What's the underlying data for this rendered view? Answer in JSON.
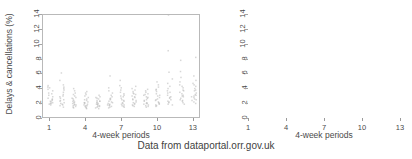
{
  "caption": "Data from dataportal.orr.gov.uk",
  "axis": {
    "ylabel": "Delays & cancellations (%)",
    "xlabel": "4-week periods",
    "yticks": [
      "0",
      "2",
      "4",
      "6",
      "8",
      "10",
      "12",
      "14"
    ],
    "xticks": [
      "1",
      "4",
      "7",
      "10",
      "13"
    ]
  },
  "chart_data": [
    {
      "type": "scatter",
      "title": "",
      "xlabel": "4-week periods",
      "ylabel": "Delays & cancellations (%)",
      "xlim": [
        0.4,
        13.6
      ],
      "ylim": [
        0,
        14
      ],
      "yticks": [
        0,
        2,
        4,
        6,
        8,
        10,
        12,
        14
      ],
      "xticks": [
        1,
        4,
        7,
        10,
        13
      ],
      "grid": false,
      "legend": "none",
      "marker": "strip-jitter",
      "point_color": "#b6b6b6",
      "note": "strip chart: each 4-week period column shows one point per train operator",
      "points": [
        {
          "x": 1,
          "values": [
            1.9,
            2.0,
            2.1,
            2.2,
            2.3,
            2.4,
            2.5,
            2.6,
            2.8,
            3.0,
            3.2,
            3.5,
            3.8,
            4.0,
            4.2,
            4.3,
            4.5,
            2.1,
            2.7,
            3.4
          ]
        },
        {
          "x": 2,
          "values": [
            1.6,
            1.8,
            1.9,
            2.0,
            2.1,
            2.2,
            2.4,
            2.6,
            2.8,
            3.0,
            3.3,
            3.6,
            3.9,
            4.1,
            4.3,
            4.6,
            5.2,
            6.2,
            2.5,
            3.1
          ]
        },
        {
          "x": 3,
          "values": [
            1.5,
            1.6,
            1.7,
            1.8,
            1.9,
            2.0,
            2.1,
            2.2,
            2.3,
            2.5,
            2.7,
            2.9,
            3.1,
            3.3,
            3.5,
            3.8,
            4.1,
            1.9,
            2.4,
            2.8
          ]
        },
        {
          "x": 4,
          "values": [
            1.4,
            1.5,
            1.6,
            1.7,
            1.8,
            1.9,
            2.0,
            2.1,
            2.2,
            2.3,
            2.5,
            2.7,
            2.9,
            3.1,
            3.3,
            3.5,
            3.7,
            1.8,
            2.2,
            2.6
          ]
        },
        {
          "x": 5,
          "values": [
            1.4,
            1.5,
            1.6,
            1.7,
            1.8,
            1.9,
            2.0,
            2.1,
            2.2,
            2.3,
            2.4,
            2.5,
            2.7,
            2.9,
            3.0,
            3.2,
            1.7,
            2.0,
            2.4,
            2.8
          ]
        },
        {
          "x": 6,
          "values": [
            1.5,
            1.6,
            1.7,
            1.8,
            1.9,
            2.0,
            2.1,
            2.2,
            2.4,
            2.6,
            2.8,
            3.0,
            3.2,
            3.5,
            3.8,
            4.2,
            5.8,
            1.9,
            2.3,
            2.7
          ]
        },
        {
          "x": 7,
          "values": [
            1.6,
            1.7,
            1.8,
            1.9,
            2.0,
            2.2,
            2.4,
            2.6,
            2.8,
            3.0,
            3.2,
            3.4,
            3.6,
            3.9,
            4.2,
            4.5,
            5.2,
            2.1,
            2.5,
            3.1
          ]
        },
        {
          "x": 8,
          "values": [
            1.7,
            1.8,
            1.9,
            2.0,
            2.1,
            2.3,
            2.5,
            2.7,
            2.9,
            3.1,
            3.3,
            3.5,
            3.7,
            3.9,
            4.1,
            4.4,
            2.2,
            2.6,
            3.0,
            3.4
          ]
        },
        {
          "x": 9,
          "values": [
            1.6,
            1.7,
            1.8,
            1.9,
            2.0,
            2.1,
            2.2,
            2.4,
            2.6,
            2.8,
            3.0,
            3.2,
            3.4,
            3.6,
            3.8,
            4.0,
            2.1,
            2.5,
            2.9,
            3.3
          ]
        },
        {
          "x": 10,
          "values": [
            1.7,
            1.8,
            1.9,
            2.0,
            2.1,
            2.3,
            2.5,
            2.7,
            2.9,
            3.1,
            3.4,
            3.7,
            4.0,
            4.3,
            4.6,
            5.0,
            2.2,
            2.6,
            3.2,
            3.9
          ]
        },
        {
          "x": 11,
          "values": [
            1.9,
            2.0,
            2.2,
            2.4,
            2.6,
            2.8,
            3.0,
            3.2,
            3.5,
            3.8,
            4.1,
            4.4,
            4.8,
            5.4,
            6.3,
            9.2,
            14.0,
            2.3,
            2.9,
            3.6
          ]
        },
        {
          "x": 12,
          "values": [
            2.0,
            2.2,
            2.4,
            2.6,
            2.8,
            3.0,
            3.2,
            3.4,
            3.6,
            3.9,
            4.2,
            4.6,
            5.0,
            5.6,
            6.4,
            7.9,
            2.5,
            3.1,
            3.8,
            4.4
          ]
        },
        {
          "x": 13,
          "values": [
            2.1,
            2.3,
            2.5,
            2.7,
            2.9,
            3.1,
            3.3,
            3.5,
            3.8,
            4.1,
            4.4,
            4.8,
            5.2,
            5.8,
            8.3,
            2.6,
            3.2,
            3.9,
            4.6,
            3.0
          ]
        }
      ]
    },
    {
      "type": "line",
      "title": "",
      "xlabel": "4-week periods",
      "ylabel": "Delays & cancellations (%)",
      "xlim": [
        1,
        13
      ],
      "ylim": [
        0,
        14
      ],
      "yticks": [
        0,
        2,
        4,
        6,
        8,
        10,
        12,
        14
      ],
      "xticks": [
        1,
        4,
        7,
        10,
        13
      ],
      "grid": false,
      "legend": "none",
      "x": [
        1,
        2,
        3,
        4,
        5,
        6,
        7,
        8,
        9,
        10,
        11,
        12,
        13
      ],
      "series": [
        {
          "name": "operator-01",
          "color": "#c8c8c8",
          "values": [
            4.5,
            6.2,
            3.4,
            2.7,
            3.2,
            5.8,
            5.2,
            4.0,
            3.6,
            4.9,
            14.0,
            7.9,
            8.3
          ]
        },
        {
          "name": "operator-02",
          "color": "#bdbdbd",
          "values": [
            4.3,
            4.6,
            3.1,
            2.5,
            2.6,
            3.5,
            4.5,
            4.4,
            3.8,
            4.6,
            9.2,
            6.4,
            5.6
          ]
        },
        {
          "name": "operator-03",
          "color": "#b2b2b2",
          "values": [
            4.2,
            4.3,
            2.9,
            2.4,
            2.4,
            3.0,
            4.2,
            4.1,
            3.5,
            4.3,
            6.3,
            5.6,
            5.2
          ]
        },
        {
          "name": "operator-04",
          "color": "#a8a8a8",
          "values": [
            4.0,
            4.1,
            2.8,
            2.3,
            2.3,
            2.8,
            3.9,
            3.9,
            3.3,
            4.0,
            5.4,
            5.0,
            4.8
          ]
        },
        {
          "name": "operator-05",
          "color": "#9e9e9e",
          "values": [
            3.8,
            3.9,
            2.7,
            2.2,
            2.2,
            2.6,
            3.6,
            3.7,
            3.1,
            3.7,
            4.8,
            4.6,
            4.4
          ]
        },
        {
          "name": "operator-06",
          "color": "#949494",
          "values": [
            3.5,
            3.6,
            2.5,
            2.1,
            2.1,
            2.4,
            3.4,
            3.5,
            3.0,
            3.4,
            4.4,
            4.2,
            4.1
          ]
        },
        {
          "name": "operator-07",
          "color": "#8c8c8c",
          "values": [
            3.2,
            3.3,
            2.4,
            2.0,
            2.0,
            2.2,
            3.2,
            3.3,
            2.9,
            3.2,
            4.1,
            3.9,
            3.9
          ]
        },
        {
          "name": "operator-08",
          "color": "#858585",
          "values": [
            3.0,
            3.1,
            2.3,
            1.9,
            2.0,
            2.1,
            3.0,
            3.1,
            2.8,
            3.1,
            3.8,
            3.6,
            3.8
          ]
        },
        {
          "name": "operator-09",
          "color": "#7f7f7f",
          "values": [
            2.8,
            3.0,
            2.2,
            1.9,
            1.9,
            2.0,
            2.8,
            2.9,
            2.6,
            2.9,
            3.5,
            3.4,
            3.5
          ]
        },
        {
          "name": "operator-10",
          "color": "#8a8a8a",
          "values": [
            2.6,
            2.8,
            2.1,
            1.8,
            1.9,
            2.0,
            2.6,
            2.7,
            2.5,
            2.7,
            3.2,
            3.2,
            3.3
          ]
        },
        {
          "name": "operator-11",
          "color": "#939393",
          "values": [
            2.5,
            2.6,
            2.0,
            1.8,
            1.8,
            1.9,
            2.5,
            2.6,
            2.4,
            2.6,
            3.0,
            3.1,
            3.2
          ]
        },
        {
          "name": "operator-12",
          "color": "#9b9b9b",
          "values": [
            2.4,
            2.5,
            2.0,
            1.7,
            1.8,
            1.9,
            2.4,
            2.5,
            2.2,
            2.5,
            2.9,
            3.0,
            3.1
          ]
        },
        {
          "name": "operator-13",
          "color": "#a3a3a3",
          "values": [
            2.3,
            2.4,
            1.9,
            1.7,
            1.7,
            1.8,
            2.2,
            2.3,
            2.1,
            2.3,
            2.8,
            2.8,
            3.0
          ]
        },
        {
          "name": "operator-14",
          "color": "#ababab",
          "values": [
            2.2,
            2.2,
            1.9,
            1.6,
            1.7,
            1.8,
            2.1,
            2.2,
            2.0,
            2.2,
            2.6,
            2.6,
            2.9
          ]
        },
        {
          "name": "operator-15",
          "color": "#b0b0b0",
          "values": [
            2.1,
            2.1,
            1.8,
            1.6,
            1.6,
            1.7,
            2.0,
            2.1,
            1.9,
            2.1,
            2.4,
            2.5,
            2.7
          ]
        },
        {
          "name": "operator-16",
          "color": "#b5b5b5",
          "values": [
            2.1,
            2.0,
            1.7,
            1.5,
            1.6,
            1.7,
            1.9,
            2.0,
            1.8,
            2.0,
            2.3,
            2.4,
            2.6
          ]
        },
        {
          "name": "operator-17",
          "color": "#bababa",
          "values": [
            2.0,
            1.9,
            1.7,
            1.5,
            1.5,
            1.6,
            1.8,
            1.9,
            1.8,
            1.9,
            2.2,
            2.2,
            2.5
          ]
        },
        {
          "name": "operator-18",
          "color": "#9a9a9a",
          "values": [
            2.0,
            1.8,
            1.6,
            1.4,
            1.5,
            1.6,
            1.7,
            1.8,
            1.7,
            1.8,
            2.0,
            2.1,
            2.3
          ]
        },
        {
          "name": "operator-19",
          "color": "#a6a6a6",
          "values": [
            1.9,
            1.8,
            1.5,
            1.4,
            1.4,
            1.5,
            1.6,
            1.7,
            1.6,
            1.7,
            1.9,
            2.0,
            2.2
          ]
        },
        {
          "name": "operator-20",
          "color": "#8f8f8f",
          "values": [
            2.2,
            2.3,
            2.6,
            2.0,
            2.5,
            4.2,
            3.5,
            2.8,
            2.3,
            3.5,
            6.0,
            5.8,
            3.2
          ]
        }
      ]
    }
  ]
}
